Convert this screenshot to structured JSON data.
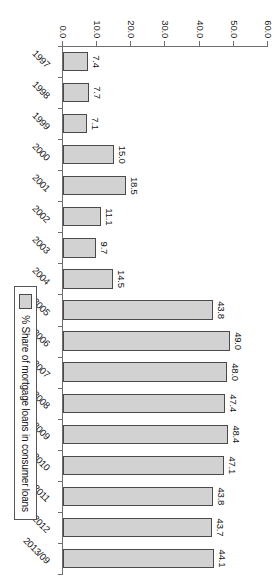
{
  "chart_data": {
    "type": "bar",
    "orientation": "vertical-rotated-90cw",
    "title": "",
    "subtitle": "",
    "xlabel": "",
    "ylabel": "",
    "categories": [
      "1997",
      "1998",
      "1999",
      "2000",
      "2001",
      "2002",
      "2003",
      "2004",
      "2005",
      "2006",
      "2007",
      "2008",
      "2009",
      "2010",
      "2011",
      "2012",
      "2013/09"
    ],
    "values": [
      7.4,
      7.7,
      7.1,
      15.0,
      18.5,
      11.1,
      9.7,
      14.5,
      43.8,
      49.0,
      48.0,
      47.4,
      48.4,
      47.1,
      43.8,
      43.7,
      44.1
    ],
    "data_labels": [
      "7.4",
      "7.7",
      "7.1",
      "15.0",
      "18.5",
      "11.1",
      "9.7",
      "14.5",
      "43.8",
      "49.0",
      "48.0",
      "47.4",
      "48.4",
      "47.1",
      "43.8",
      "43.7",
      "44.1"
    ],
    "ylim": [
      0.0,
      60.0
    ],
    "ytick_values": [
      0.0,
      10.0,
      20.0,
      30.0,
      40.0,
      50.0,
      60.0
    ],
    "ytick_labels": [
      "0.0",
      "10.0",
      "20.0",
      "30.0",
      "40.0",
      "50.0",
      "60.0"
    ],
    "grid": false,
    "legend_position": "bottom-right",
    "series": [
      {
        "name": "% Share of mortgage loans in consumer loans",
        "color": "#d2d2d2",
        "border_color": "#4a4a4a",
        "values": [
          7.4,
          7.7,
          7.1,
          15.0,
          18.5,
          11.1,
          9.7,
          14.5,
          43.8,
          49.0,
          48.0,
          47.4,
          48.4,
          47.1,
          43.8,
          43.7,
          44.1
        ]
      }
    ]
  },
  "legend": {
    "label": "% Share of mortgage loans in consumer loans",
    "swatch_color": "#d2d2d2"
  },
  "colors": {
    "bar_fill": "#d2d2d2",
    "bar_border": "#4a4a4a",
    "axis": "#6f6f6f",
    "text": "#111111",
    "background": "#ffffff"
  }
}
